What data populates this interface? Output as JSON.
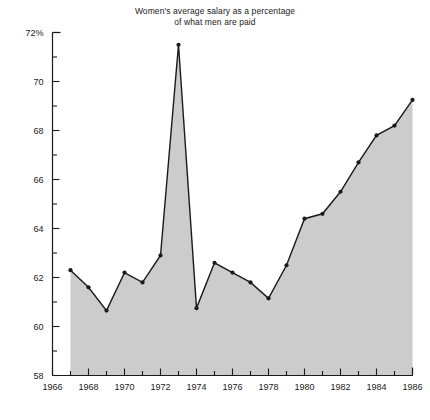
{
  "chart": {
    "title_line1": "Women's average salary as a percentage",
    "title_line2": "of what men are paid",
    "y_axis_unit_label": "72%"
  },
  "chart_data": {
    "type": "area",
    "title": "Women's average salary as a percentage of what men are paid",
    "subtitle": "",
    "xlabel": "",
    "ylabel": "",
    "x": [
      1967,
      1968,
      1969,
      1970,
      1971,
      1972,
      1973,
      1974,
      1975,
      1976,
      1977,
      1978,
      1979,
      1980,
      1981,
      1982,
      1983,
      1984,
      1985,
      1986
    ],
    "values": [
      62.3,
      61.6,
      60.65,
      62.2,
      61.8,
      62.9,
      71.5,
      60.75,
      62.6,
      62.2,
      61.8,
      61.15,
      62.5,
      64.4,
      64.6,
      65.5,
      66.7,
      67.8,
      68.2,
      69.25
    ],
    "series": [
      {
        "name": "Women's salary as % of men's",
        "values": [
          62.3,
          61.6,
          60.65,
          62.2,
          61.8,
          62.9,
          71.5,
          60.75,
          62.6,
          62.2,
          61.8,
          61.15,
          62.5,
          64.4,
          64.6,
          65.5,
          66.7,
          67.8,
          68.2,
          69.25
        ]
      }
    ],
    "xlim": [
      1966,
      1986
    ],
    "ylim": [
      58,
      72
    ],
    "x_ticks_major": [
      1966,
      1968,
      1970,
      1972,
      1974,
      1976,
      1978,
      1980,
      1982,
      1984,
      1986
    ],
    "x_tick_labels": [
      "1966",
      "1968",
      "1970",
      "1972",
      "1974",
      "1976",
      "1978",
      "1980",
      "1982",
      "1984",
      "1986"
    ],
    "x_ticks_minor": [
      1967,
      1969,
      1971,
      1973,
      1975,
      1977,
      1979,
      1981,
      1983,
      1985
    ],
    "y_ticks_major": [
      58,
      60,
      62,
      64,
      66,
      68,
      70,
      72
    ],
    "y_tick_labels": [
      "58",
      "60",
      "62",
      "64",
      "66",
      "68",
      "70",
      "72%"
    ],
    "y_ticks_minor": [
      59,
      61,
      63,
      65,
      67,
      69,
      71
    ],
    "grid": false,
    "legend": "none",
    "marker": "filled-circle",
    "fill_color": "#cccccc",
    "line_color": "#1a1a1a",
    "axis_color": "#1a1a1a",
    "background_color": "#ffffff",
    "annotations": []
  }
}
